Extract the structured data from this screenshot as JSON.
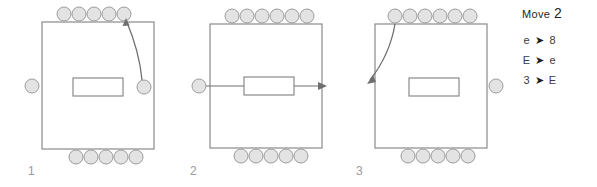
{
  "diagram": {
    "type": "state-sequence",
    "panel_count": 3,
    "colors": {
      "stroke": "#8a8a8a",
      "circle_fill": "#e3e3e3",
      "circle_stroke": "#9b9b9b",
      "arrow": "#6e6e6e",
      "text": "#231f20",
      "label": "#9a9a9a"
    },
    "panels": [
      {
        "id": "panel-1",
        "label": "1",
        "top_circles": 5,
        "bottom_circles": 5,
        "left_circles": 1,
        "right_circles": 1,
        "has_center_rect": true,
        "arrow": {
          "kind": "curved",
          "from": "right-side-circle",
          "to": "top-row-right",
          "direction": "up"
        }
      },
      {
        "id": "panel-2",
        "label": "2",
        "top_circles": 6,
        "bottom_circles": 5,
        "left_circles": 1,
        "right_circles": 0,
        "has_center_rect": true,
        "arrow": {
          "kind": "straight",
          "from": "left-side-circle",
          "to": "right-edge",
          "direction": "right"
        }
      },
      {
        "id": "panel-3",
        "label": "3",
        "top_circles": 6,
        "bottom_circles": 5,
        "left_circles": 0,
        "right_circles": 1,
        "has_center_rect": true,
        "arrow": {
          "kind": "curved",
          "from": "top-row-left",
          "to": "left-edge",
          "direction": "down-left"
        }
      }
    ]
  },
  "legend": {
    "title_word": "Move",
    "title_number": "2",
    "rows": [
      {
        "from": "e",
        "arrow": "➤",
        "to": "8"
      },
      {
        "from": "E",
        "arrow": "➤",
        "to": "e"
      },
      {
        "from": "3",
        "arrow": "➤",
        "to": "E"
      }
    ]
  }
}
